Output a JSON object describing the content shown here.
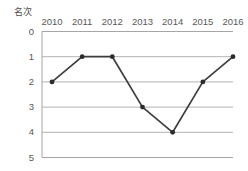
{
  "chart_data": {
    "type": "line",
    "title": "",
    "subtitle": "",
    "xlabel": "",
    "ylabel": "名次",
    "categories": [
      "2010",
      "2011",
      "2012",
      "2013",
      "2014",
      "2015",
      "2016"
    ],
    "x": [
      2010,
      2011,
      2012,
      2013,
      2014,
      2015,
      2016
    ],
    "values": [
      2,
      1,
      1,
      3,
      4,
      2,
      1
    ],
    "series": [
      {
        "name": "名次",
        "values": [
          2,
          1,
          1,
          3,
          4,
          2,
          1
        ]
      }
    ],
    "y_ticks": [
      "0",
      "1",
      "2",
      "3",
      "4",
      "5"
    ],
    "y_tick_values": [
      0,
      1,
      2,
      3,
      4,
      5
    ],
    "ylim": [
      0,
      5
    ],
    "y_inverted": true,
    "x_axis_position": "top",
    "grid": true,
    "grid_axis": "y",
    "legend": false,
    "legend_position": "none",
    "annotations": [],
    "colors": {
      "line": "#3f3f3f",
      "marker": "#2b2b2b",
      "grid": "#b3b3b3",
      "frame": "#a6a6a6",
      "text": "#595959",
      "background": "#ffffff"
    }
  }
}
